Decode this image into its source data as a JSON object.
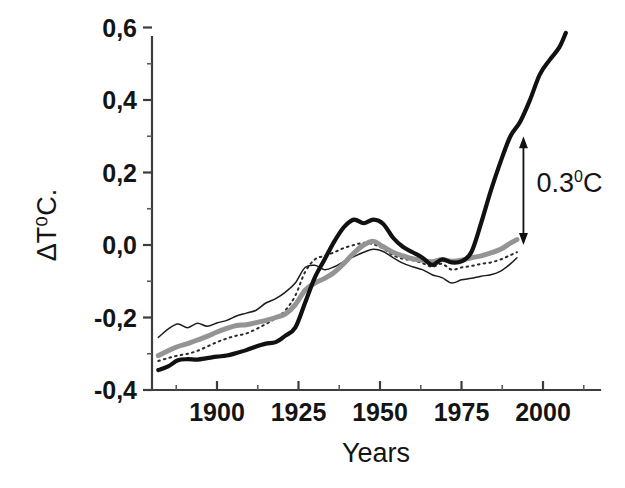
{
  "chart_data": {
    "type": "line",
    "title": "",
    "subtitle": "",
    "xlabel": "Years",
    "ylabel": "ΔT⁰C.",
    "xlim": [
      1882,
      2008
    ],
    "ylim": [
      -0.4,
      0.62
    ],
    "grid": false,
    "legend_position": "none",
    "decimal_separator": "comma",
    "x_ticks": [
      1900,
      1925,
      1950,
      1975,
      2000
    ],
    "x_tick_labels": [
      "1900",
      "1925",
      "1950",
      "1975",
      "2000"
    ],
    "x_minor_tick_interval": 12.5,
    "y_ticks": [
      -0.4,
      -0.2,
      0.0,
      0.2,
      0.4,
      0.6
    ],
    "y_tick_labels": [
      "-0,4",
      "-0,2",
      "0,0",
      "0,2",
      "0,4",
      "0,6"
    ],
    "y_minor_tick_interval": 0.1,
    "annotations": [
      {
        "name": "delta-bracket",
        "text": "0.3",
        "superscript": "0",
        "suffix": "C",
        "full_text": "0.3⁰C",
        "type": "double-headed-vertical-arrow",
        "x_year": 1994,
        "y_from": 0.0,
        "y_to": 0.3,
        "label_x_year": 1998,
        "label_y": 0.17
      }
    ],
    "series": [
      {
        "name": "thick-black",
        "style": "solid-thick-black",
        "color": "#111111",
        "linewidth": 4.2,
        "x": [
          1882,
          1885,
          1888,
          1891,
          1894,
          1897,
          1900,
          1903,
          1906,
          1909,
          1912,
          1915,
          1918,
          1921,
          1924,
          1927,
          1930,
          1933,
          1936,
          1939,
          1942,
          1945,
          1948,
          1951,
          1954,
          1957,
          1960,
          1963,
          1966,
          1969,
          1972,
          1975,
          1978,
          1981,
          1984,
          1987,
          1990,
          1993,
          1996,
          1999,
          2002,
          2005,
          2007
        ],
        "y": [
          -0.345,
          -0.335,
          -0.318,
          -0.315,
          -0.316,
          -0.312,
          -0.308,
          -0.305,
          -0.298,
          -0.29,
          -0.28,
          -0.272,
          -0.268,
          -0.25,
          -0.228,
          -0.16,
          -0.09,
          -0.04,
          0.01,
          0.05,
          0.07,
          0.06,
          0.07,
          0.058,
          0.02,
          -0.005,
          -0.02,
          -0.035,
          -0.055,
          -0.04,
          -0.048,
          -0.045,
          -0.02,
          0.06,
          0.15,
          0.23,
          0.3,
          0.34,
          0.4,
          0.47,
          0.51,
          0.545,
          0.585
        ]
      },
      {
        "name": "thick-gray",
        "style": "solid-thick-gray",
        "color": "#949494",
        "linewidth": 5.0,
        "x": [
          1882,
          1885,
          1888,
          1891,
          1894,
          1897,
          1900,
          1903,
          1906,
          1909,
          1912,
          1915,
          1918,
          1921,
          1924,
          1927,
          1930,
          1933,
          1936,
          1939,
          1942,
          1945,
          1948,
          1951,
          1954,
          1957,
          1960,
          1963,
          1966,
          1969,
          1972,
          1975,
          1978,
          1981,
          1984,
          1987,
          1990,
          1992
        ],
        "y": [
          -0.305,
          -0.292,
          -0.28,
          -0.272,
          -0.262,
          -0.252,
          -0.24,
          -0.23,
          -0.222,
          -0.22,
          -0.214,
          -0.208,
          -0.2,
          -0.19,
          -0.165,
          -0.125,
          -0.105,
          -0.092,
          -0.075,
          -0.05,
          -0.022,
          0.0,
          0.01,
          -0.005,
          -0.02,
          -0.03,
          -0.038,
          -0.042,
          -0.046,
          -0.04,
          -0.045,
          -0.042,
          -0.035,
          -0.03,
          -0.022,
          -0.012,
          0.005,
          0.015
        ]
      },
      {
        "name": "thin-black",
        "style": "solid-thin-black",
        "color": "#1c1c1c",
        "linewidth": 1.5,
        "x": [
          1882,
          1885,
          1888,
          1891,
          1894,
          1897,
          1900,
          1903,
          1906,
          1909,
          1912,
          1915,
          1918,
          1921,
          1924,
          1927,
          1930,
          1933,
          1936,
          1939,
          1942,
          1945,
          1948,
          1951,
          1954,
          1957,
          1960,
          1963,
          1966,
          1969,
          1972,
          1975,
          1978,
          1981,
          1984,
          1987,
          1990,
          1992
        ],
        "y": [
          -0.255,
          -0.232,
          -0.218,
          -0.228,
          -0.216,
          -0.224,
          -0.215,
          -0.208,
          -0.196,
          -0.188,
          -0.18,
          -0.16,
          -0.148,
          -0.13,
          -0.105,
          -0.062,
          -0.056,
          -0.068,
          -0.06,
          -0.045,
          -0.032,
          -0.02,
          -0.012,
          -0.018,
          -0.035,
          -0.05,
          -0.06,
          -0.068,
          -0.082,
          -0.09,
          -0.105,
          -0.096,
          -0.092,
          -0.086,
          -0.082,
          -0.072,
          -0.052,
          -0.035
        ]
      },
      {
        "name": "dotted",
        "style": "dotted-black",
        "color": "#2a2a2a",
        "linewidth": 2.0,
        "x": [
          1882,
          1885,
          1888,
          1891,
          1894,
          1897,
          1900,
          1903,
          1906,
          1909,
          1912,
          1915,
          1918,
          1921,
          1924,
          1927,
          1930,
          1933,
          1936,
          1939,
          1942,
          1945,
          1948,
          1951,
          1954,
          1957,
          1960,
          1963,
          1966,
          1969,
          1972,
          1975,
          1978,
          1981,
          1984,
          1987,
          1990,
          1992
        ],
        "y": [
          -0.32,
          -0.312,
          -0.305,
          -0.3,
          -0.292,
          -0.28,
          -0.268,
          -0.258,
          -0.25,
          -0.244,
          -0.232,
          -0.218,
          -0.202,
          -0.18,
          -0.14,
          -0.075,
          -0.04,
          -0.03,
          -0.02,
          -0.008,
          0.0,
          0.006,
          0.002,
          -0.01,
          -0.028,
          -0.038,
          -0.042,
          -0.05,
          -0.06,
          -0.052,
          -0.068,
          -0.062,
          -0.058,
          -0.052,
          -0.048,
          -0.04,
          -0.028,
          -0.02
        ]
      }
    ]
  }
}
